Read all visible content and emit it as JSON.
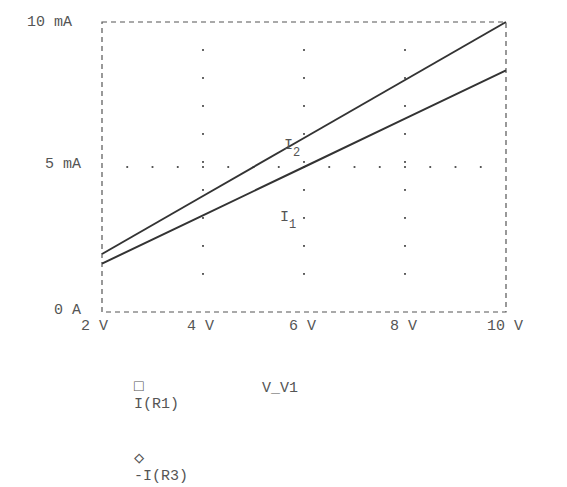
{
  "chart_data": {
    "type": "line",
    "title": "",
    "xlabel": "V_V1",
    "ylabel": "",
    "xlim": [
      2,
      10
    ],
    "ylim": [
      0,
      10
    ],
    "x_ticks": [
      "2 V",
      "4 V",
      "6 V",
      "8 V",
      "10 V"
    ],
    "y_ticks": [
      "0 A",
      "5 mA",
      "10 mA"
    ],
    "x_unit": "V",
    "y_unit": "mA",
    "grid": "dotted",
    "legend_position": "bottom-left",
    "x": [
      2,
      4,
      6,
      8,
      10
    ],
    "series": [
      {
        "name": "I(R1)",
        "marker": "square",
        "annotation": "I1",
        "values": [
          1.67,
          3.33,
          5.0,
          6.67,
          8.33
        ]
      },
      {
        "name": "-I(R3)",
        "marker": "diamond",
        "annotation": "I2",
        "values": [
          2.0,
          4.0,
          6.0,
          8.0,
          10.0
        ]
      }
    ]
  },
  "axes": {
    "y_labels": [
      {
        "text": "10 mA",
        "value": 10
      },
      {
        "text": "5 mA",
        "value": 5
      },
      {
        "text": "0 A",
        "value": 0
      }
    ],
    "x_labels": [
      {
        "text": "2 V",
        "value": 2
      },
      {
        "text": "4 V",
        "value": 4
      },
      {
        "text": "6 V",
        "value": 6
      },
      {
        "text": "8 V",
        "value": 8
      },
      {
        "text": "10 V",
        "value": 10
      }
    ],
    "x_title": "V_V1"
  },
  "annotations": {
    "i2": {
      "main": "I",
      "sub": "2"
    },
    "i1": {
      "main": "I",
      "sub": "1"
    }
  },
  "legend": {
    "items": [
      {
        "symbol": "□",
        "label": "I(R1)"
      },
      {
        "symbol": "◇",
        "label": "-I(R3)"
      }
    ]
  },
  "colors": {
    "line": "#333333",
    "axis": "#555555",
    "text": "#555555",
    "background": "#ffffff"
  }
}
